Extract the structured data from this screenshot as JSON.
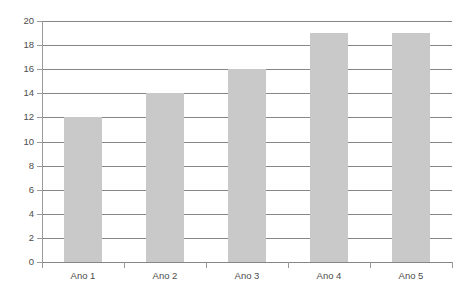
{
  "chart_data": {
    "type": "bar",
    "title": "",
    "subtitle": "",
    "xlabel": "",
    "ylabel": "",
    "categories": [
      "Ano 1",
      "Ano 2",
      "Ano 3",
      "Ano 4",
      "Ano 5"
    ],
    "values": [
      12,
      14,
      16,
      19,
      19
    ],
    "series": [
      {
        "name": "",
        "values": [
          12,
          14,
          16,
          19,
          19
        ]
      }
    ],
    "ylim": [
      0,
      20
    ],
    "y_ticks": [
      0,
      2,
      4,
      6,
      8,
      10,
      12,
      14,
      16,
      18,
      20
    ],
    "y_tick_labels": [
      "0",
      "2",
      "4",
      "6",
      "8",
      "10",
      "12",
      "14",
      "16",
      "18",
      "20"
    ],
    "grid": true,
    "grid_axis": "y",
    "legend": false,
    "legend_position": "none",
    "bar_color": "#c9c9c9",
    "gridline_color": "#868686",
    "axis_color": "#9a9a9a",
    "tick_label_color": "#4d4d4d",
    "background_color": "#ffffff",
    "annotations": []
  }
}
